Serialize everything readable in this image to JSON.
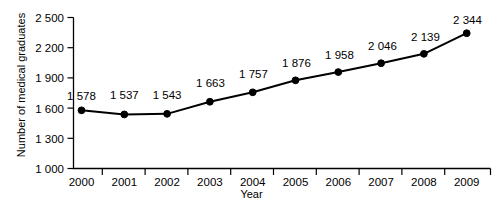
{
  "chart_data": {
    "type": "line",
    "title": "",
    "xlabel": "Year",
    "ylabel": "Number of medical graduates",
    "categories": [
      "2000",
      "2001",
      "2002",
      "2003",
      "2004",
      "2005",
      "2006",
      "2007",
      "2008",
      "2009"
    ],
    "values": [
      1578,
      1537,
      1543,
      1663,
      1757,
      1876,
      1958,
      2046,
      2139,
      2344
    ],
    "point_labels": [
      "1 578",
      "1 537",
      "1 543",
      "1 663",
      "1 757",
      "1 876",
      "1 958",
      "2 046",
      "2 139",
      "2 344"
    ],
    "ylim": [
      1000,
      2500
    ],
    "y_ticks": [
      1000,
      1300,
      1600,
      1900,
      2200,
      2500
    ],
    "y_tick_labels": [
      "1 000",
      "1 300",
      "1 600",
      "1 900",
      "2 200",
      "2 500"
    ],
    "x_tick_labels": [
      "2000",
      "2001",
      "2002",
      "2003",
      "2004",
      "2005",
      "2006",
      "2007",
      "2008",
      "2009"
    ],
    "grid": false,
    "legend": "none",
    "series": [
      {
        "name": "Number of medical graduates",
        "values": [
          1578,
          1537,
          1543,
          1663,
          1757,
          1876,
          1958,
          2046,
          2139,
          2344
        ],
        "color": "#000000",
        "marker": "filled-circle"
      }
    ],
    "colors": {
      "line": "#000000",
      "marker": "#000000",
      "axis": "#000000",
      "text": "#000000",
      "background": "#ffffff"
    }
  }
}
